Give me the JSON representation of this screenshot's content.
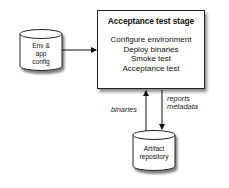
{
  "stage": {
    "title": "Acceptance test stage",
    "steps": [
      "Configure environment",
      "Deploy binaries",
      "Smoke test",
      "Acceptance test"
    ]
  },
  "env_config": {
    "lines": [
      "Env &",
      "app",
      "config"
    ]
  },
  "artifact_repo": {
    "lines": [
      "Artifact",
      "repository"
    ]
  },
  "edges": {
    "up_label": "binaries",
    "down_label": [
      "reports",
      "metadata"
    ]
  }
}
